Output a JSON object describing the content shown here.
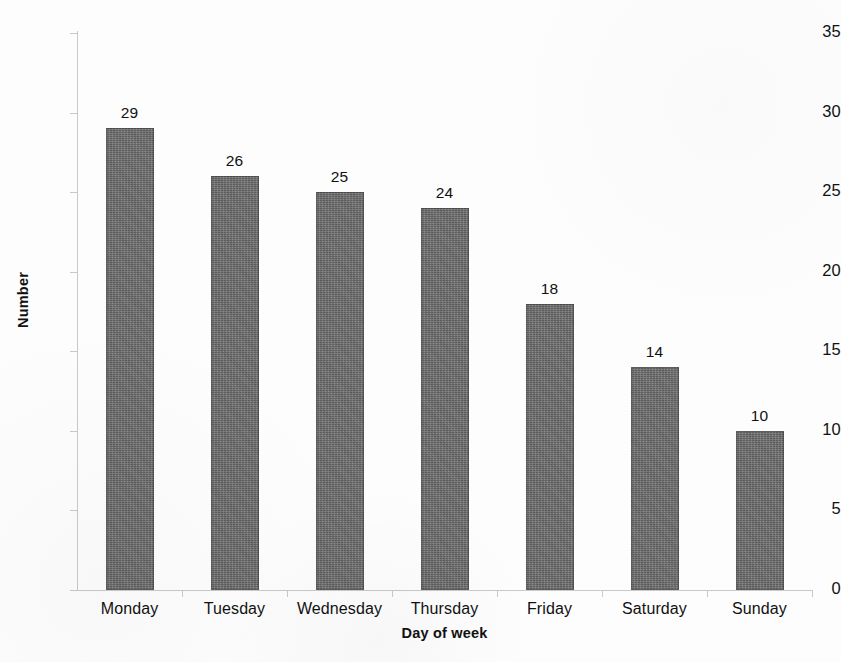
{
  "chart_data": {
    "type": "bar",
    "title": "",
    "subtitle": "",
    "xlabel": "Day of week",
    "ylabel": "Number",
    "categories": [
      "Monday",
      "Tuesday",
      "Wednesday",
      "Thursday",
      "Friday",
      "Saturday",
      "Sunday"
    ],
    "values": [
      29,
      26,
      25,
      24,
      18,
      14,
      10
    ],
    "data_labels": [
      "29",
      "26",
      "25",
      "24",
      "18",
      "14",
      "10"
    ],
    "ylim": [
      0,
      35
    ],
    "y_ticks": [
      0,
      5,
      10,
      15,
      20,
      25,
      30,
      35
    ],
    "y_tick_labels": [
      "0",
      "5",
      "10",
      "15",
      "20",
      "25",
      "30",
      "35"
    ],
    "grid": false,
    "legend": null,
    "legend_position": "none",
    "bar_color": "#6a6a6a",
    "axis_color": "#c9c9c9",
    "text_color": "#111111",
    "background_color": "#ffffff"
  }
}
